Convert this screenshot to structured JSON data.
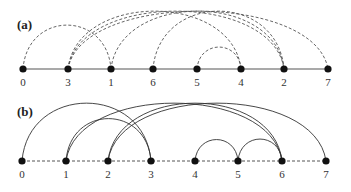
{
  "panels": [
    {
      "label": "(a)",
      "baseline_style": "solid",
      "arc_style": "dashed",
      "node_y": 69,
      "nodes": [
        {
          "label": "0",
          "x": 23
        },
        {
          "label": "3",
          "x": 68
        },
        {
          "label": "1",
          "x": 111
        },
        {
          "label": "6",
          "x": 153
        },
        {
          "label": "5",
          "x": 197
        },
        {
          "label": "4",
          "x": 241
        },
        {
          "label": "2",
          "x": 284
        },
        {
          "label": "7",
          "x": 328
        }
      ],
      "arcs": [
        {
          "from": "0",
          "to": "1"
        },
        {
          "from": "3",
          "to": "7"
        },
        {
          "from": "3",
          "to": "2"
        },
        {
          "from": "3",
          "to": "4"
        },
        {
          "from": "1",
          "to": "2"
        },
        {
          "from": "6",
          "to": "2"
        },
        {
          "from": "5",
          "to": "4"
        }
      ]
    },
    {
      "label": "(b)",
      "baseline_style": "dashed",
      "arc_style": "solid",
      "node_y": 161,
      "nodes": [
        {
          "label": "0",
          "x": 22
        },
        {
          "label": "1",
          "x": 66
        },
        {
          "label": "2",
          "x": 108
        },
        {
          "label": "3",
          "x": 151
        },
        {
          "label": "4",
          "x": 195
        },
        {
          "label": "5",
          "x": 238
        },
        {
          "label": "6",
          "x": 282
        },
        {
          "label": "7",
          "x": 326
        }
      ],
      "arcs": [
        {
          "from": "0",
          "to": "3"
        },
        {
          "from": "1",
          "to": "3"
        },
        {
          "from": "1",
          "to": "6"
        },
        {
          "from": "2",
          "to": "6"
        },
        {
          "from": "2",
          "to": "7"
        },
        {
          "from": "4",
          "to": "5"
        },
        {
          "from": "5",
          "to": "6"
        }
      ]
    }
  ]
}
